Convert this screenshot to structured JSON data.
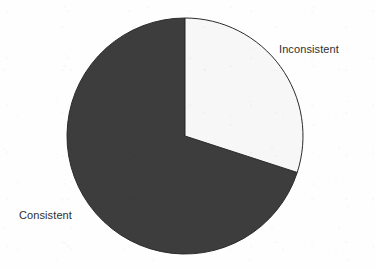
{
  "figure": {
    "background_color": "#fefefe",
    "width": 375,
    "height": 269
  },
  "chart_data": {
    "type": "pie",
    "title": "",
    "subtitle": "",
    "xlabel": "",
    "ylabel": "",
    "legend_position": "none",
    "grid": false,
    "labels_shown": "adjacent-to-slice",
    "start_angle_deg": 0,
    "direction": "clockwise",
    "categories": [
      "Inconsistent",
      "Consistent"
    ],
    "values": [
      30,
      70
    ],
    "value_unit": "percent",
    "slices": [
      {
        "label": "Inconsistent",
        "value": 30,
        "start_angle_deg": 0,
        "end_angle_deg": 108,
        "sweep_deg": 108,
        "fill_color": "#f7f7f7",
        "stroke_color": "#2b2b2b",
        "label_position": "top-right"
      },
      {
        "label": "Consistent",
        "value": 70,
        "start_angle_deg": 108,
        "end_angle_deg": 360,
        "sweep_deg": 252,
        "fill_color": "#3d3d3d",
        "stroke_color": "#2b2b2b",
        "label_position": "left"
      }
    ],
    "geometry": {
      "center_x": 185,
      "center_y": 136,
      "radius": 118
    }
  },
  "labels": {
    "inconsistent": "Inconsistent",
    "consistent": "Consistent"
  },
  "colors": {
    "dark_slice": "#3d3d3d",
    "light_slice": "#f7f7f7",
    "outline": "#2b2b2b",
    "label_text": "#2f2f2f",
    "background": "#fefefe"
  }
}
